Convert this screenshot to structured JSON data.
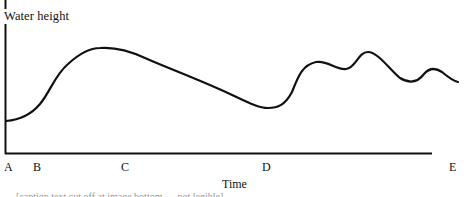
{
  "figure": {
    "y_axis_label": "Water height",
    "x_axis_label": "Time",
    "x_markers": [
      {
        "label": "A",
        "x": 4
      },
      {
        "label": "B",
        "x": 34
      },
      {
        "label": "C",
        "x": 121
      },
      {
        "label": "D",
        "x": 262
      },
      {
        "label": "E",
        "x": 449
      }
    ],
    "curve_description": "Water height starts low at A, rises after B to a broad peak near C, declines to a minimum just before D, then rises sharply into several smaller peaks toward E",
    "caption_fragment": "[caption text cut off at image bottom — not legible]",
    "colors": {
      "line": "#111111",
      "axes": "#111111",
      "background": "#ffffff"
    }
  }
}
